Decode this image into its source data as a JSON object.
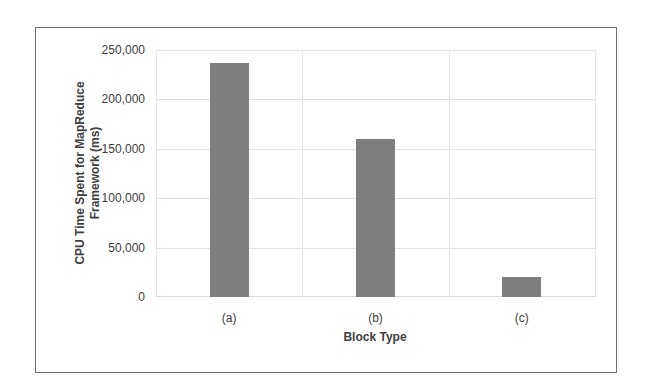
{
  "chart_data": {
    "type": "bar",
    "title": "",
    "xlabel": "Block Type",
    "ylabel": "CPU Time Spent for MapReduce Framework (ms)",
    "ylabel_lines": [
      "CPU Time Spent for MapReduce",
      "Framework (ms)"
    ],
    "categories": [
      "(a)",
      "(b)",
      "(c)"
    ],
    "values": [
      237000,
      160000,
      20000
    ],
    "ylim": [
      0,
      250000
    ],
    "yticks": [
      0,
      50000,
      100000,
      150000,
      200000,
      250000
    ],
    "ytick_labels": [
      "0",
      "50,000",
      "100,000",
      "150,000",
      "200,000",
      "250,000"
    ],
    "grid": true,
    "legend": null,
    "bar_color": "#7f7f7f"
  }
}
